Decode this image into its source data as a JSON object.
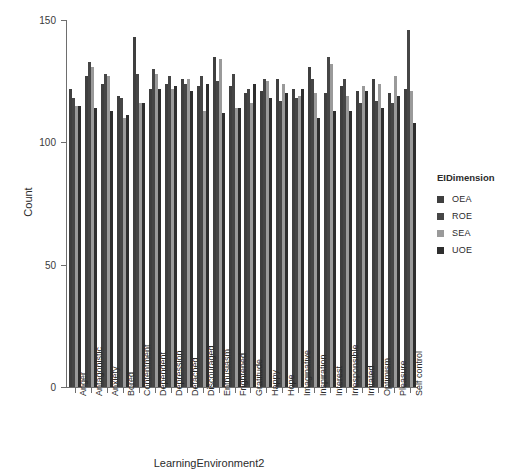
{
  "chart_data": {
    "type": "bar",
    "title": "",
    "xlabel": "LearningEnvironment2",
    "ylabel": "Count",
    "ylim": [
      0,
      150
    ],
    "yticks": [
      0,
      50,
      100,
      150
    ],
    "grid": false,
    "legend_title": "EIDimension",
    "legend_position": "right",
    "categories": [
      "Anger",
      "Antagonistic",
      "Anxiety",
      "Bored",
      "Contentment",
      "Dependent",
      "Depression",
      "Detached",
      "Discouraged",
      "Enthusiasm",
      "Frightened",
      "Gratitude",
      "Happy",
      "Hope",
      "Imaginative",
      "Inspiration",
      "Interest",
      "Irresponsible",
      "Irritated",
      "Optimism",
      "Pleasure",
      "Self control"
    ],
    "series": [
      {
        "name": "OEA",
        "color": "#3f3f3f",
        "values": [
          122,
          127,
          124,
          119,
          143,
          122,
          124,
          126,
          123,
          135,
          123,
          120,
          121,
          126,
          122,
          131,
          120,
          123,
          121,
          126,
          120,
          122
        ]
      },
      {
        "name": "ROE",
        "color": "#464646",
        "values": [
          118,
          133,
          128,
          118,
          128,
          130,
          127,
          124,
          127,
          125,
          128,
          122,
          126,
          117,
          118,
          126,
          135,
          126,
          116,
          117,
          116,
          146
        ]
      },
      {
        "name": "SEA",
        "color": "#9a9a9a",
        "values": [
          115,
          131,
          127,
          110,
          116,
          128,
          122,
          126,
          113,
          134,
          114,
          116,
          125,
          124,
          119,
          120,
          132,
          119,
          123,
          124,
          127,
          121
        ]
      },
      {
        "name": "UOE",
        "color": "#2e2e2e",
        "values": [
          115,
          114,
          113,
          111,
          116,
          122,
          123,
          121,
          124,
          112,
          114,
          124,
          118,
          120,
          122,
          110,
          113,
          113,
          121,
          114,
          119,
          108
        ]
      }
    ]
  },
  "legend": {
    "title": "EIDimension",
    "items": [
      {
        "label": "OEA",
        "color": "#3f3f3f"
      },
      {
        "label": "ROE",
        "color": "#464646"
      },
      {
        "label": "SEA",
        "color": "#9a9a9a"
      },
      {
        "label": "UOE",
        "color": "#2e2e2e"
      }
    ]
  },
  "axes": {
    "y_title": "Count",
    "x_title": "LearningEnvironment2",
    "y_tick_labels": [
      "150",
      "100",
      "50",
      "0"
    ]
  }
}
